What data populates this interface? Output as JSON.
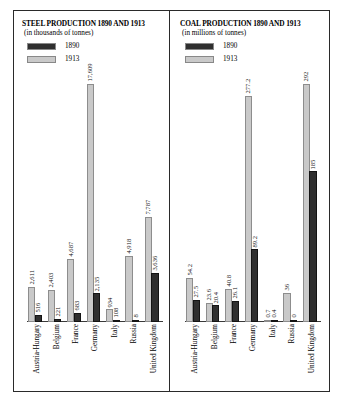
{
  "page": {
    "background": "#ffffff",
    "frame_color": "#2a2a2a"
  },
  "colors": {
    "series_1890": "#2f2f2f",
    "series_1913": "#c9c9c9"
  },
  "panels": [
    {
      "id": "steel",
      "title": "STEEL PRODUCTION 1890 AND 1913",
      "subtitle": "(in thousands of tonnes)",
      "legend": [
        {
          "label": "1890",
          "color": "#2f2f2f"
        },
        {
          "label": "1913",
          "color": "#c9c9c9"
        }
      ]
    },
    {
      "id": "coal",
      "title": "COAL PRODUCTION 1890 AND 1913",
      "subtitle": "(in millions of tonnes)",
      "legend": [
        {
          "label": "1890",
          "color": "#2f2f2f"
        },
        {
          "label": "1913",
          "color": "#c9c9c9"
        }
      ]
    }
  ],
  "chart_data": [
    {
      "type": "bar",
      "title": "STEEL PRODUCTION 1890 AND 1913",
      "subtitle": "(in thousands of tonnes)",
      "xlabel": "",
      "ylabel": "thousands of tonnes",
      "ylim": [
        0,
        17609
      ],
      "grid": false,
      "legend_position": "top-left",
      "categories": [
        "Austria-Hungary",
        "Belgium",
        "France",
        "Germany",
        "Italy",
        "Russia",
        "United Kingdom"
      ],
      "series": [
        {
          "name": "1890",
          "color": "#2f2f2f",
          "values": [
            516,
            221,
            683,
            2135,
            108,
            8,
            3636
          ],
          "labels": [
            "516",
            "221",
            "683",
            "2,135",
            "108",
            "8",
            "3,636"
          ]
        },
        {
          "name": "1913",
          "color": "#c9c9c9",
          "values": [
            2611,
            2403,
            4687,
            17609,
            934,
            4918,
            7787
          ],
          "labels": [
            "2,611",
            "2,403",
            "4,687",
            "17,609",
            "934",
            "4,918",
            "7,787"
          ]
        }
      ]
    },
    {
      "type": "bar",
      "title": "COAL PRODUCTION 1890 AND 1913",
      "subtitle": "(in millions of tonnes)",
      "xlabel": "",
      "ylabel": "millions of tonnes",
      "ylim": [
        0,
        292
      ],
      "grid": false,
      "legend_position": "top-left",
      "categories": [
        "Austria-Hungary",
        "Belgium",
        "France",
        "Germany",
        "Italy",
        "Russia",
        "United Kingdom"
      ],
      "series": [
        {
          "name": "1890",
          "color": "#2f2f2f",
          "values": [
            27.5,
            20.4,
            26.1,
            89.2,
            0.4,
            0.0,
            185
          ],
          "labels": [
            "27.5",
            "20.4",
            "26.1",
            "89.2",
            "0.4",
            "0",
            "185"
          ]
        },
        {
          "name": "1913",
          "color": "#c9c9c9",
          "values": [
            54.2,
            23.6,
            40.8,
            277.2,
            0.7,
            36,
            292
          ],
          "labels": [
            "54.2",
            "23.6",
            "40.8",
            "277.2",
            "0.7",
            "36",
            "292"
          ]
        }
      ]
    }
  ]
}
